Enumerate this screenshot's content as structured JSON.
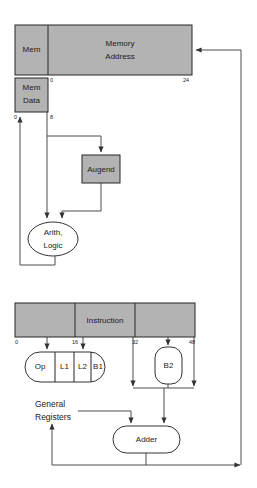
{
  "diagram": {
    "colors": {
      "register_fill": "#b3b3b3",
      "unit_fill": "#ffffff",
      "stroke": "#262626",
      "wire": "#4d4d4d",
      "background": "#ffffff"
    },
    "registers": [
      {
        "name": "memory-address-register",
        "label": "Memory\nAddress",
        "label_line1": "Memory",
        "label_line2": "Address",
        "fields": [
          {
            "name": "mem",
            "label": "Mem"
          },
          {
            "name": "memory-address",
            "label_line1": "Memory",
            "label_line2": "Address"
          }
        ],
        "bit_ticks": [
          {
            "label": "0"
          },
          {
            "label": "24"
          }
        ]
      },
      {
        "name": "mem-data-register",
        "label_line1": "Mem",
        "label_line2": "Data",
        "bit_ticks": [
          {
            "label": "0"
          },
          {
            "label": "8"
          }
        ]
      },
      {
        "name": "instruction-register",
        "label": "Instruction",
        "bit_ticks": [
          {
            "label": "0"
          },
          {
            "label": "16"
          },
          {
            "label": "32"
          },
          {
            "label": "48"
          }
        ]
      }
    ],
    "units": [
      {
        "name": "augend",
        "label": "Augend",
        "shape": "rect"
      },
      {
        "name": "arith-logic",
        "label_line1": "Arith,",
        "label_line2": "Logic",
        "shape": "ellipse"
      },
      {
        "name": "adder",
        "label": "Adder",
        "shape": "rounded"
      },
      {
        "name": "b2",
        "label": "B2",
        "shape": "rounded"
      }
    ],
    "instruction_fields": [
      {
        "name": "op",
        "label": "Op"
      },
      {
        "name": "l1",
        "label": "L1"
      },
      {
        "name": "l2",
        "label": "L2"
      },
      {
        "name": "b1",
        "label": "B1"
      }
    ],
    "annotations": [
      {
        "name": "general-registers",
        "label_line1": "General",
        "label_line2": "Registers"
      }
    ]
  }
}
